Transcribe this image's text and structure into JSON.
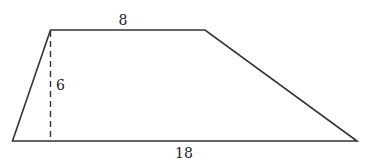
{
  "diagram": {
    "shape": "trapezoid",
    "colors": {
      "line": "#333333",
      "background": "#ffffff",
      "text": "#222222"
    },
    "vertices": {
      "top_left": [
        50.5,
        30
      ],
      "top_right": [
        205,
        30
      ],
      "bottom_right": [
        357,
        141
      ],
      "bottom_left": [
        12.5,
        141
      ]
    },
    "height_line": {
      "style": "dashed",
      "from": [
        50.5,
        30
      ],
      "to": [
        50.5,
        141
      ]
    },
    "labels": {
      "top_base": "8",
      "height": "6",
      "bottom_base": "18"
    }
  }
}
